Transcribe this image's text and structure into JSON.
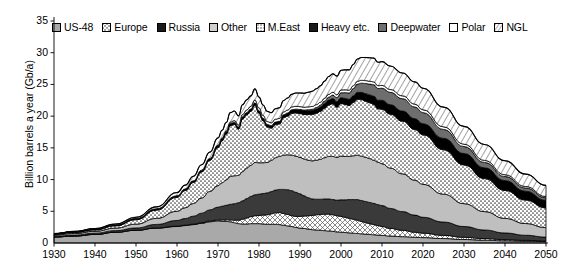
{
  "chart_data": {
    "type": "area",
    "stacked": true,
    "title": "",
    "xlabel": "",
    "ylabel": "Billion barrels a year (Gb/a)",
    "xlim": [
      1930,
      2050
    ],
    "ylim": [
      0,
      35
    ],
    "xticks": [
      1930,
      1940,
      1950,
      1960,
      1970,
      1980,
      1990,
      2000,
      2010,
      2020,
      2030,
      2040,
      2050
    ],
    "yticks": [
      0,
      5,
      10,
      15,
      20,
      25,
      30,
      35
    ],
    "grid": false,
    "legend_position": "top",
    "x": [
      1930,
      1935,
      1940,
      1945,
      1950,
      1955,
      1960,
      1962,
      1964,
      1966,
      1968,
      1970,
      1971,
      1972,
      1973,
      1974,
      1975,
      1976,
      1977,
      1978,
      1979,
      1980,
      1981,
      1982,
      1983,
      1984,
      1985,
      1986,
      1987,
      1988,
      1989,
      1990,
      1991,
      1992,
      1993,
      1994,
      1995,
      1996,
      1997,
      1998,
      1999,
      2000,
      2001,
      2002,
      2003,
      2004,
      2005,
      2006,
      2007,
      2008,
      2009,
      2010,
      2012,
      2015,
      2018,
      2020,
      2025,
      2030,
      2035,
      2040,
      2045,
      2050
    ],
    "series": [
      {
        "name": "US-48",
        "fill": "#a9a9a9",
        "pattern": "solid-mid-gray",
        "values": [
          0.95,
          1.1,
          1.35,
          1.7,
          2.0,
          2.35,
          2.6,
          2.75,
          2.9,
          3.1,
          3.35,
          3.5,
          3.45,
          3.4,
          3.35,
          3.2,
          3.05,
          3.0,
          3.0,
          3.05,
          3.05,
          3.05,
          3.0,
          2.95,
          2.95,
          2.95,
          2.9,
          2.8,
          2.7,
          2.6,
          2.45,
          2.35,
          2.3,
          2.2,
          2.1,
          2.05,
          2.0,
          1.95,
          1.9,
          1.85,
          1.75,
          1.7,
          1.65,
          1.6,
          1.55,
          1.5,
          1.45,
          1.4,
          1.35,
          1.3,
          1.25,
          1.2,
          1.1,
          1.0,
          0.9,
          0.85,
          0.7,
          0.55,
          0.45,
          0.35,
          0.3,
          0.25
        ]
      },
      {
        "name": "Europe",
        "fill": "#ffffff",
        "pattern": "crosshatch",
        "values": [
          0.0,
          0.0,
          0.0,
          0.0,
          0.02,
          0.03,
          0.05,
          0.06,
          0.08,
          0.1,
          0.12,
          0.15,
          0.2,
          0.25,
          0.3,
          0.4,
          0.55,
          0.75,
          0.95,
          1.1,
          1.25,
          1.3,
          1.4,
          1.5,
          1.65,
          1.8,
          1.9,
          1.85,
          1.8,
          1.7,
          1.75,
          1.85,
          1.95,
          2.1,
          2.25,
          2.4,
          2.5,
          2.6,
          2.65,
          2.6,
          2.55,
          2.5,
          2.4,
          2.3,
          2.2,
          2.1,
          1.95,
          1.8,
          1.7,
          1.6,
          1.5,
          1.4,
          1.2,
          1.0,
          0.8,
          0.7,
          0.5,
          0.35,
          0.25,
          0.18,
          0.12,
          0.08
        ]
      },
      {
        "name": "Russia",
        "fill": "#3a3a3a",
        "pattern": "solid-dark",
        "values": [
          0.1,
          0.15,
          0.2,
          0.25,
          0.35,
          0.55,
          0.9,
          1.05,
          1.25,
          1.5,
          1.75,
          2.0,
          2.15,
          2.3,
          2.45,
          2.6,
          2.75,
          2.9,
          3.05,
          3.2,
          3.3,
          3.35,
          3.4,
          3.45,
          3.5,
          3.6,
          3.65,
          3.8,
          3.9,
          3.95,
          3.8,
          3.55,
          3.2,
          2.85,
          2.6,
          2.45,
          2.4,
          2.4,
          2.4,
          2.4,
          2.45,
          2.6,
          2.75,
          2.95,
          3.1,
          3.25,
          3.3,
          3.35,
          3.35,
          3.35,
          3.3,
          3.3,
          3.15,
          2.95,
          2.7,
          2.5,
          2.1,
          1.7,
          1.35,
          1.05,
          0.8,
          0.6
        ]
      },
      {
        "name": "Other",
        "fill": "#bfbfbf",
        "pattern": "solid-light-gray",
        "values": [
          0.2,
          0.25,
          0.3,
          0.4,
          0.6,
          0.95,
          1.45,
          1.7,
          2.0,
          2.4,
          2.9,
          3.4,
          3.7,
          4.0,
          4.4,
          4.4,
          4.3,
          4.6,
          4.8,
          4.9,
          5.1,
          4.95,
          4.85,
          4.8,
          4.9,
          5.1,
          5.2,
          5.4,
          5.5,
          5.6,
          5.7,
          5.75,
          5.8,
          5.9,
          6.0,
          6.15,
          6.3,
          6.5,
          6.7,
          6.8,
          6.75,
          6.9,
          6.85,
          6.8,
          6.9,
          7.0,
          7.0,
          6.95,
          6.9,
          6.8,
          6.7,
          6.6,
          6.35,
          5.95,
          5.5,
          5.2,
          4.4,
          3.6,
          2.9,
          2.3,
          1.85,
          1.5
        ]
      },
      {
        "name": "M.East",
        "fill": "#ffffff",
        "pattern": "dots",
        "values": [
          0.1,
          0.15,
          0.2,
          0.35,
          0.7,
          1.3,
          2.2,
          2.7,
          3.3,
          4.1,
          4.9,
          6.0,
          6.6,
          7.2,
          8.0,
          8.1,
          7.3,
          8.3,
          8.4,
          8.5,
          9.0,
          7.8,
          6.6,
          5.6,
          5.1,
          5.2,
          5.1,
          5.9,
          6.1,
          6.6,
          6.8,
          6.9,
          7.0,
          7.2,
          7.3,
          7.4,
          7.55,
          7.8,
          8.1,
          8.3,
          7.9,
          8.3,
          8.2,
          8.0,
          8.4,
          8.8,
          8.9,
          8.85,
          8.8,
          8.8,
          8.4,
          8.6,
          8.5,
          8.3,
          8.0,
          7.8,
          7.0,
          6.1,
          5.2,
          4.4,
          3.7,
          3.1
        ]
      },
      {
        "name": "Heavy etc.",
        "fill": "#000000",
        "pattern": "solid-black",
        "values": [
          0.12,
          0.13,
          0.15,
          0.17,
          0.2,
          0.22,
          0.25,
          0.26,
          0.27,
          0.28,
          0.3,
          0.32,
          0.33,
          0.34,
          0.35,
          0.35,
          0.35,
          0.36,
          0.37,
          0.38,
          0.4,
          0.4,
          0.4,
          0.4,
          0.4,
          0.42,
          0.43,
          0.45,
          0.47,
          0.5,
          0.52,
          0.55,
          0.58,
          0.6,
          0.63,
          0.66,
          0.7,
          0.74,
          0.78,
          0.82,
          0.86,
          0.9,
          0.95,
          1.0,
          1.05,
          1.1,
          1.15,
          1.2,
          1.25,
          1.3,
          1.35,
          1.4,
          1.5,
          1.6,
          1.7,
          1.75,
          1.8,
          1.8,
          1.7,
          1.55,
          1.4,
          1.2
        ]
      },
      {
        "name": "Deepwater",
        "fill": "#6e6e6e",
        "pattern": "solid-dkgray",
        "values": [
          0.0,
          0.0,
          0.0,
          0.0,
          0.0,
          0.0,
          0.0,
          0.0,
          0.0,
          0.0,
          0.0,
          0.0,
          0.0,
          0.0,
          0.0,
          0.0,
          0.0,
          0.0,
          0.0,
          0.0,
          0.0,
          0.0,
          0.0,
          0.0,
          0.0,
          0.0,
          0.0,
          0.02,
          0.04,
          0.06,
          0.08,
          0.1,
          0.13,
          0.16,
          0.2,
          0.25,
          0.3,
          0.38,
          0.46,
          0.55,
          0.65,
          0.78,
          0.9,
          1.0,
          1.15,
          1.3,
          1.45,
          1.6,
          1.7,
          1.8,
          1.85,
          1.9,
          1.95,
          1.95,
          1.85,
          1.75,
          1.4,
          1.1,
          0.85,
          0.65,
          0.5,
          0.4
        ]
      },
      {
        "name": "Polar",
        "fill": "#ffffff",
        "pattern": "white",
        "values": [
          0.0,
          0.0,
          0.0,
          0.0,
          0.0,
          0.0,
          0.0,
          0.0,
          0.0,
          0.0,
          0.0,
          0.05,
          0.1,
          0.15,
          0.2,
          0.25,
          0.3,
          0.35,
          0.4,
          0.42,
          0.45,
          0.45,
          0.45,
          0.45,
          0.45,
          0.45,
          0.45,
          0.45,
          0.45,
          0.45,
          0.45,
          0.45,
          0.45,
          0.45,
          0.45,
          0.45,
          0.45,
          0.45,
          0.45,
          0.45,
          0.45,
          0.45,
          0.45,
          0.45,
          0.45,
          0.45,
          0.45,
          0.45,
          0.45,
          0.45,
          0.45,
          0.45,
          0.45,
          0.45,
          0.45,
          0.45,
          0.42,
          0.38,
          0.32,
          0.28,
          0.24,
          0.2
        ]
      },
      {
        "name": "NGL",
        "fill": "#ffffff",
        "pattern": "diagonal-hatch",
        "values": [
          0.03,
          0.05,
          0.08,
          0.12,
          0.2,
          0.3,
          0.5,
          0.6,
          0.72,
          0.85,
          1.0,
          1.15,
          1.25,
          1.35,
          1.5,
          1.5,
          1.45,
          1.55,
          1.6,
          1.65,
          1.75,
          1.7,
          1.65,
          1.6,
          1.6,
          1.65,
          1.7,
          1.8,
          1.9,
          2.0,
          2.1,
          2.15,
          2.2,
          2.3,
          2.4,
          2.5,
          2.6,
          2.7,
          2.8,
          2.9,
          2.95,
          3.1,
          3.15,
          3.2,
          3.35,
          3.5,
          3.6,
          3.65,
          3.7,
          3.75,
          3.7,
          3.75,
          3.7,
          3.6,
          3.5,
          3.4,
          3.1,
          2.8,
          2.5,
          2.2,
          1.95,
          1.75
        ]
      }
    ]
  },
  "legend": {
    "items": [
      {
        "label": "US-48",
        "pattern": "solid-mid-gray",
        "color": "#a9a9a9"
      },
      {
        "label": "Europe",
        "pattern": "crosshatch",
        "color": "#ffffff"
      },
      {
        "label": "Russia",
        "pattern": "solid-black",
        "color": "#1a1a1a"
      },
      {
        "label": "Other",
        "pattern": "solid-light-gray",
        "color": "#bfbfbf"
      },
      {
        "label": "M.East",
        "pattern": "dots",
        "color": "#ffffff"
      },
      {
        "label": "Heavy etc.",
        "pattern": "solid-black",
        "color": "#000000"
      },
      {
        "label": "Deepwater",
        "pattern": "solid-dkgray",
        "color": "#6e6e6e"
      },
      {
        "label": "Polar",
        "pattern": "white",
        "color": "#ffffff"
      },
      {
        "label": "NGL",
        "pattern": "diagonal-hatch",
        "color": "#ffffff"
      }
    ]
  }
}
